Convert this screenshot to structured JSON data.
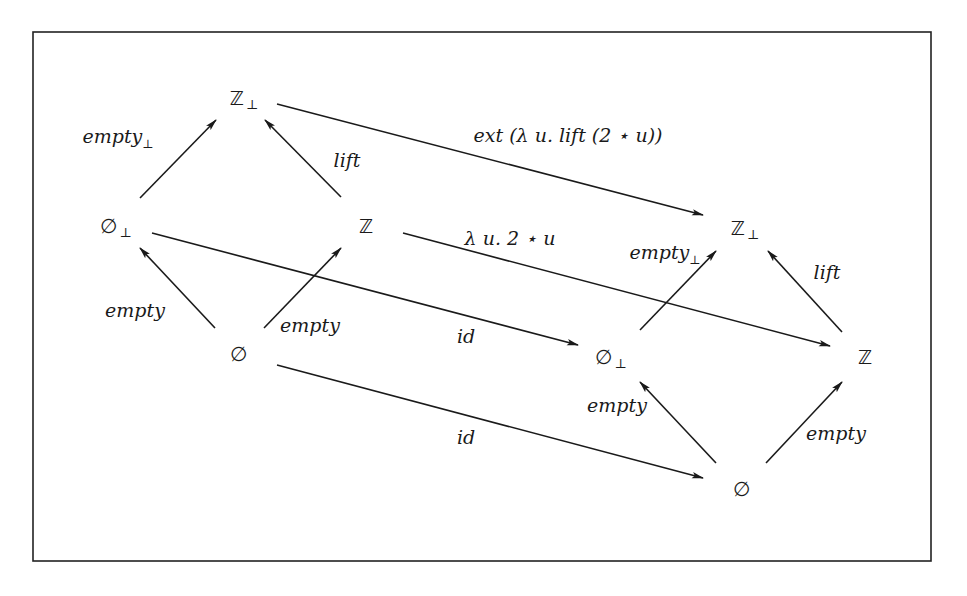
{
  "diagram": {
    "frame": {
      "x": 33,
      "y": 32,
      "width": 898,
      "height": 529,
      "stroke": "#222222"
    },
    "line_color": "#1a1a1a",
    "nodes": {
      "left_Zbot": {
        "symbol": "ℤ",
        "sub": "⊥",
        "x": 244,
        "y": 98
      },
      "left_Ebot": {
        "symbol": "∅",
        "sub": "⊥",
        "x": 116,
        "y": 226
      },
      "left_Z": {
        "symbol": "ℤ",
        "sub": "",
        "x": 366,
        "y": 226
      },
      "left_E": {
        "symbol": "∅",
        "sub": "",
        "x": 238,
        "y": 354
      },
      "right_Zbot": {
        "symbol": "ℤ",
        "sub": "⊥",
        "x": 745,
        "y": 228
      },
      "right_Ebot": {
        "symbol": "∅",
        "sub": "⊥",
        "x": 611,
        "y": 357
      },
      "right_Z": {
        "symbol": "ℤ",
        "sub": "",
        "x": 865,
        "y": 357
      },
      "right_E": {
        "symbol": "∅",
        "sub": "",
        "x": 741,
        "y": 489
      }
    },
    "edges": [
      {
        "id": "l-empty-bot",
        "label": "empty",
        "sub": "⊥",
        "x1": 140,
        "y1": 198,
        "x2": 216,
        "y2": 120,
        "lx": 118,
        "ly": 136
      },
      {
        "id": "l-lift",
        "label": "lift",
        "sub": "",
        "x1": 341,
        "y1": 197,
        "x2": 265,
        "y2": 120,
        "lx": 347,
        "ly": 160
      },
      {
        "id": "l-empty-1",
        "label": "empty",
        "sub": "",
        "x1": 215,
        "y1": 328,
        "x2": 140,
        "y2": 248,
        "lx": 135,
        "ly": 310
      },
      {
        "id": "l-empty-2",
        "label": "empty",
        "sub": "",
        "x1": 264,
        "y1": 328,
        "x2": 341,
        "y2": 248,
        "lx": 310,
        "ly": 325
      },
      {
        "id": "ext",
        "label": "ext (λ u. lift (2 ⋆ u))",
        "sub": "",
        "x1": 277,
        "y1": 104,
        "x2": 703,
        "y2": 215,
        "lx": 568,
        "ly": 135
      },
      {
        "id": "lambda",
        "label": "λ u. 2 ⋆ u",
        "sub": "",
        "x1": 403,
        "y1": 233,
        "x2": 830,
        "y2": 346,
        "lx": 510,
        "ly": 238
      },
      {
        "id": "id-top",
        "label": "id",
        "sub": "",
        "x1": 152,
        "y1": 233,
        "x2": 578,
        "y2": 345,
        "lx": 466,
        "ly": 336
      },
      {
        "id": "id-bottom",
        "label": "id",
        "sub": "",
        "x1": 277,
        "y1": 365,
        "x2": 703,
        "y2": 478,
        "lx": 466,
        "ly": 437
      },
      {
        "id": "r-empty-bot",
        "label": "empty",
        "sub": "⊥",
        "x1": 640,
        "y1": 330,
        "x2": 716,
        "y2": 251,
        "lx": 665,
        "ly": 252
      },
      {
        "id": "r-lift",
        "label": "lift",
        "sub": "",
        "x1": 842,
        "y1": 332,
        "x2": 768,
        "y2": 251,
        "lx": 827,
        "ly": 272
      },
      {
        "id": "r-empty-1",
        "label": "empty",
        "sub": "",
        "x1": 716,
        "y1": 463,
        "x2": 640,
        "y2": 382,
        "lx": 617,
        "ly": 405
      },
      {
        "id": "r-empty-2",
        "label": "empty",
        "sub": "",
        "x1": 766,
        "y1": 463,
        "x2": 842,
        "y2": 382,
        "lx": 836,
        "ly": 433
      }
    ]
  }
}
